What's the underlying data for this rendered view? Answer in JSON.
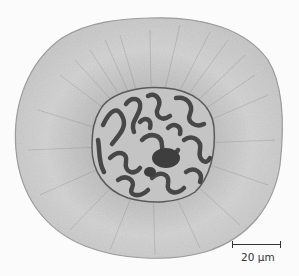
{
  "figure": {
    "colors": {
      "background": "#fbfbfb",
      "cytoplasm": "#d4d4d4",
      "cytoplasm_edge": "#9a9a9a",
      "perinuclear_fibers": "#7a7a7a",
      "nucleus_bg": "#c8c8c8",
      "chromatin": "#4a4a4a"
    }
  },
  "scale_bar": {
    "label": "20 µm"
  }
}
